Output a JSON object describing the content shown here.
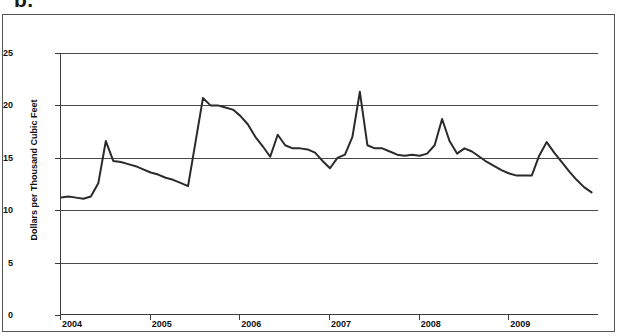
{
  "figure": {
    "panel_label": "b."
  },
  "chart_data": {
    "type": "line",
    "title": "",
    "xlabel": "",
    "ylabel": "Dollars per Thousand Cubic Feet",
    "ylim": [
      0,
      25
    ],
    "yticks": [
      0,
      5,
      10,
      15,
      20,
      25
    ],
    "ytick_labels": [
      "0",
      "5",
      "10",
      "15",
      "20",
      "25"
    ],
    "xlim": [
      2004.0,
      2010.0
    ],
    "xticks": [
      2004,
      2005,
      2006,
      2007,
      2008,
      2009
    ],
    "xtick_labels": [
      "2004",
      "2005",
      "2006",
      "2007",
      "2008",
      "2009"
    ],
    "grid": "horizontal",
    "legend": "none",
    "line_color": "#2b2b2b",
    "line_width": 2,
    "markers": "none",
    "x": [
      2004.0,
      2004.083,
      2004.167,
      2004.25,
      2004.333,
      2004.417,
      2004.5,
      2004.583,
      2004.667,
      2004.75,
      2004.833,
      2004.917,
      2005.0,
      2005.083,
      2005.167,
      2005.25,
      2005.333,
      2005.417,
      2005.5,
      2005.583,
      2005.667,
      2005.75,
      2005.833,
      2005.917,
      2006.0,
      2006.083,
      2006.167,
      2006.25,
      2006.333,
      2006.417,
      2006.5,
      2006.583,
      2006.667,
      2006.75,
      2006.833,
      2006.917,
      2007.0,
      2007.083,
      2007.167,
      2007.25,
      2007.333,
      2007.417,
      2007.5,
      2007.583,
      2007.667,
      2007.75,
      2007.833,
      2007.917,
      2008.0,
      2008.083,
      2008.167,
      2008.25,
      2008.333,
      2008.417,
      2008.5,
      2008.583,
      2008.667,
      2008.75,
      2008.833,
      2008.917,
      2009.0,
      2009.083,
      2009.167,
      2009.25,
      2009.333,
      2009.417,
      2009.5,
      2009.583,
      2009.667,
      2009.75,
      2009.833,
      2009.917
    ],
    "values": [
      11.2,
      11.3,
      11.2,
      11.1,
      11.3,
      12.6,
      16.6,
      14.7,
      14.6,
      14.4,
      14.2,
      13.9,
      13.6,
      13.4,
      13.1,
      12.9,
      12.6,
      12.3,
      16.5,
      20.7,
      20.0,
      20.0,
      19.8,
      19.6,
      19.0,
      18.2,
      17.0,
      16.1,
      15.1,
      17.2,
      16.2,
      15.9,
      15.9,
      15.8,
      15.5,
      14.7,
      14.0,
      15.0,
      15.3,
      17.0,
      21.3,
      16.2,
      15.9,
      15.9,
      15.6,
      15.3,
      15.2,
      15.3,
      15.2,
      15.4,
      16.2,
      18.7,
      16.6,
      15.4,
      15.9,
      15.6,
      15.1,
      14.6,
      14.2,
      13.8,
      13.5,
      13.3,
      13.3,
      13.3,
      15.2,
      16.5,
      15.5,
      14.6,
      13.7,
      12.9,
      12.2,
      11.7
    ],
    "series": [
      {
        "name": "Residential natural gas price",
        "values": [
          11.2,
          11.3,
          11.2,
          11.1,
          11.3,
          12.6,
          16.6,
          14.7,
          14.6,
          14.4,
          14.2,
          13.9,
          13.6,
          13.4,
          13.1,
          12.9,
          12.6,
          12.3,
          16.5,
          20.7,
          20.0,
          20.0,
          19.8,
          19.6,
          19.0,
          18.2,
          17.0,
          16.1,
          15.1,
          17.2,
          16.2,
          15.9,
          15.9,
          15.8,
          15.5,
          14.7,
          14.0,
          15.0,
          15.3,
          17.0,
          21.3,
          16.2,
          15.9,
          15.9,
          15.6,
          15.3,
          15.2,
          15.3,
          15.2,
          15.4,
          16.2,
          18.7,
          16.6,
          15.4,
          15.9,
          15.6,
          15.1,
          14.6,
          14.2,
          13.8,
          13.5,
          13.3,
          13.3,
          13.3,
          15.2,
          16.5,
          15.5,
          14.6,
          13.7,
          12.9,
          12.2,
          11.7
        ]
      }
    ]
  }
}
